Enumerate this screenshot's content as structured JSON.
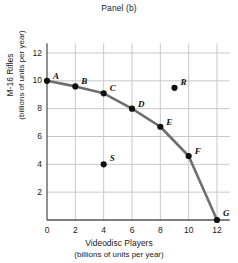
{
  "chart_data": {
    "type": "line",
    "title": "Panel (b)",
    "xlabel": "Videodisc Players",
    "xlabel_units": "(billions of units per year)",
    "ylabel": "M-16 Rifles",
    "ylabel_units": "(billions of units per year)",
    "xlim": [
      0,
      12
    ],
    "ylim": [
      0,
      12
    ],
    "xticks": [
      0,
      2,
      4,
      6,
      8,
      10,
      12
    ],
    "yticks": [
      2,
      4,
      6,
      8,
      10,
      12
    ],
    "grid": true,
    "legend": "none",
    "curve_color": "#6e6e6e",
    "point_color": "#111111",
    "grid_color": "#c8c8c8",
    "axis_color": "#555555",
    "series": [
      {
        "name": "Production Possibilities Frontier",
        "style": "curve-with-markers",
        "points": [
          {
            "label": "A",
            "x": 0,
            "y": 10.0,
            "label_dx": 6,
            "label_dy": -10
          },
          {
            "label": "B",
            "x": 2,
            "y": 9.6,
            "label_dx": 6,
            "label_dy": -10
          },
          {
            "label": "C",
            "x": 4,
            "y": 9.1,
            "label_dx": 6,
            "label_dy": -10
          },
          {
            "label": "D",
            "x": 6,
            "y": 8.0,
            "label_dx": 6,
            "label_dy": -10
          },
          {
            "label": "E",
            "x": 8,
            "y": 6.7,
            "label_dx": 6,
            "label_dy": -10
          },
          {
            "label": "F",
            "x": 10,
            "y": 4.6,
            "label_dx": 6,
            "label_dy": -10
          },
          {
            "label": "G",
            "x": 12,
            "y": 0.0,
            "label_dx": 6,
            "label_dy": -12
          }
        ]
      }
    ],
    "extra_points": [
      {
        "label": "R",
        "x": 9,
        "y": 9.5,
        "note": "unattainable point above frontier",
        "label_dx": 6,
        "label_dy": -11
      },
      {
        "label": "S",
        "x": 4,
        "y": 4.0,
        "note": "inefficient point below frontier",
        "label_dx": 6,
        "label_dy": -11
      }
    ]
  }
}
